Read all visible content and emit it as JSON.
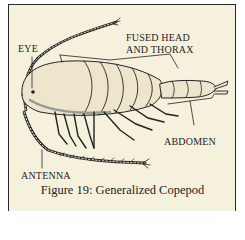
{
  "figure": {
    "caption": "Figure 19: Generalized Copepod",
    "labels": {
      "eye": "EYE",
      "fused_head_line1": "FUSED HEAD",
      "fused_head_line2": "AND THORAX",
      "abdomen": "ABDOMEN",
      "antenna": "ANTENNA"
    },
    "colors": {
      "background": "#f6f1dc",
      "ink": "#1e1e1e",
      "border": "#2a2a2a"
    }
  }
}
